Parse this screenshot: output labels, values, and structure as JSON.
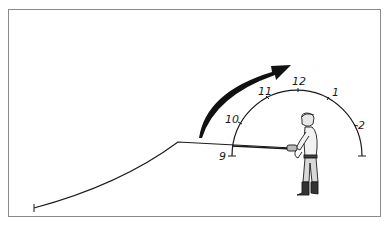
{
  "diagram": {
    "type": "fly-casting-clock",
    "clock_labels": [
      "9",
      "10",
      "11",
      "12",
      "1",
      "2"
    ],
    "arrow_direction": "clockwise",
    "colors": {
      "ink": "#1a1a1a",
      "frame": "#8a8a8a",
      "background": "#ffffff"
    }
  }
}
